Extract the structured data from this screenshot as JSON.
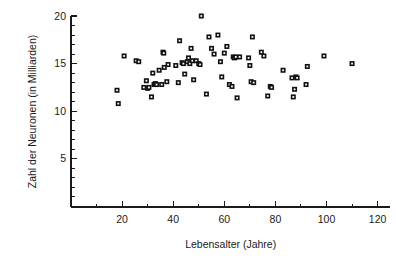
{
  "chart_data": {
    "type": "scatter",
    "title": "",
    "xlabel": "Lebensalter (Jahre)",
    "ylabel": "Zahl der Neuronen (in Milliarden)",
    "xlim": [
      0,
      125
    ],
    "ylim": [
      0,
      21
    ],
    "grid": false,
    "legend": null,
    "xticks": [
      20,
      40,
      60,
      80,
      100,
      120
    ],
    "xtick_labels": [
      "20",
      "40",
      "60",
      "80",
      "100",
      "120"
    ],
    "xminor_step": 10,
    "yticks": [
      5,
      10,
      15,
      20
    ],
    "ytick_labels": [
      "5",
      "10",
      "15",
      "20"
    ],
    "yminor_step": 1,
    "marker": "open-square",
    "marker_color": "#111111",
    "series": [
      {
        "name": "Neuronenzahl",
        "points": [
          [
            18.0,
            12.2
          ],
          [
            18.5,
            10.8
          ],
          [
            20.8,
            15.8
          ],
          [
            25.5,
            15.3
          ],
          [
            26.5,
            15.2
          ],
          [
            28.5,
            12.5
          ],
          [
            29.5,
            13.2
          ],
          [
            30.0,
            12.4
          ],
          [
            30.5,
            12.5
          ],
          [
            31.5,
            11.5
          ],
          [
            32.0,
            14.0
          ],
          [
            32.5,
            12.8
          ],
          [
            33.0,
            12.9
          ],
          [
            33.5,
            12.8
          ],
          [
            34.5,
            14.3
          ],
          [
            35.5,
            12.8
          ],
          [
            36.0,
            16.2
          ],
          [
            36.3,
            16.1
          ],
          [
            36.5,
            14.6
          ],
          [
            37.5,
            13.1
          ],
          [
            38.0,
            14.9
          ],
          [
            41.0,
            14.8
          ],
          [
            42.0,
            13.0
          ],
          [
            42.5,
            17.4
          ],
          [
            43.5,
            15.1
          ],
          [
            44.0,
            15.0
          ],
          [
            44.5,
            13.9
          ],
          [
            45.5,
            15.2
          ],
          [
            46.0,
            15.6
          ],
          [
            46.5,
            15.0
          ],
          [
            47.0,
            16.6
          ],
          [
            47.5,
            15.3
          ],
          [
            48.0,
            13.3
          ],
          [
            49.0,
            15.3
          ],
          [
            50.0,
            15.0
          ],
          [
            50.5,
            14.9
          ],
          [
            51.0,
            20.0
          ],
          [
            53.0,
            11.8
          ],
          [
            54.0,
            17.8
          ],
          [
            55.0,
            16.6
          ],
          [
            56.0,
            16.0
          ],
          [
            57.5,
            18.0
          ],
          [
            58.5,
            15.2
          ],
          [
            59.0,
            13.6
          ],
          [
            60.0,
            16.1
          ],
          [
            61.0,
            16.8
          ],
          [
            62.0,
            12.8
          ],
          [
            63.0,
            12.6
          ],
          [
            63.5,
            15.7
          ],
          [
            64.0,
            15.6
          ],
          [
            64.5,
            15.7
          ],
          [
            65.0,
            11.4
          ],
          [
            66.0,
            15.7
          ],
          [
            69.5,
            15.6
          ],
          [
            70.0,
            14.8
          ],
          [
            70.5,
            13.1
          ],
          [
            71.0,
            17.8
          ],
          [
            71.5,
            13.0
          ],
          [
            74.5,
            16.2
          ],
          [
            75.5,
            15.8
          ],
          [
            77.0,
            11.6
          ],
          [
            78.0,
            12.6
          ],
          [
            78.5,
            12.5
          ],
          [
            83.0,
            14.3
          ],
          [
            86.5,
            13.5
          ],
          [
            87.0,
            11.5
          ],
          [
            87.5,
            12.3
          ],
          [
            88.0,
            13.6
          ],
          [
            88.5,
            13.5
          ],
          [
            92.0,
            12.8
          ],
          [
            92.5,
            14.7
          ],
          [
            99.0,
            15.8
          ],
          [
            110.0,
            15.0
          ]
        ]
      }
    ]
  },
  "axes_geometry": {
    "origin_x_px": 71,
    "origin_y_px": 207,
    "x_px_per_unit": 2.555,
    "y_px_per_unit": 9.52,
    "y_top_value": 20,
    "y_top_px": 16
  }
}
